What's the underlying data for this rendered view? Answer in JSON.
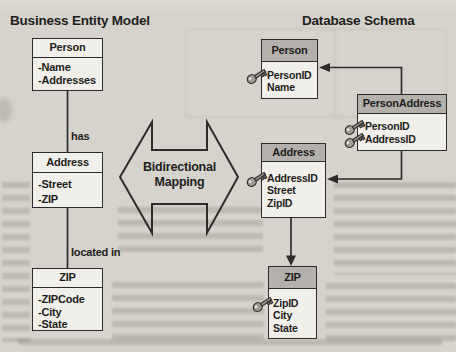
{
  "colors": {
    "background": "#d6d3cc",
    "box_fill": "#f1efe9",
    "header_fill": "#b4b1ac",
    "line": "#2d2c2a",
    "text": "#1e1d1b"
  },
  "left_model": {
    "title": "Business Entity Model",
    "entities": [
      {
        "name": "Person",
        "fields": [
          "-Name",
          "-Addresses"
        ]
      },
      {
        "name": "Address",
        "fields": [
          "-Street",
          "-ZIP"
        ]
      },
      {
        "name": "ZIP",
        "fields": [
          "-ZIPCode",
          "-City",
          "-State"
        ]
      }
    ],
    "relation_labels": [
      "has",
      "located in"
    ]
  },
  "center": {
    "label_line1": "Bidirectional",
    "label_line2": "Mapping"
  },
  "right_schema": {
    "title": "Database Schema",
    "tables": [
      {
        "name": "Person",
        "fields": [
          {
            "name": "PersonID",
            "key": true
          },
          {
            "name": "Name",
            "key": false
          }
        ]
      },
      {
        "name": "PersonAddress",
        "fields": [
          {
            "name": "PersonID",
            "key": true
          },
          {
            "name": "AddressID",
            "key": true
          }
        ]
      },
      {
        "name": "Address",
        "fields": [
          {
            "name": "AddressID",
            "key": true
          },
          {
            "name": "Street",
            "key": false
          },
          {
            "name": "ZipID",
            "key": false
          }
        ]
      },
      {
        "name": "ZIP",
        "fields": [
          {
            "name": "ZipID",
            "key": true
          },
          {
            "name": "City",
            "key": false
          },
          {
            "name": "State",
            "key": false
          }
        ]
      }
    ]
  }
}
